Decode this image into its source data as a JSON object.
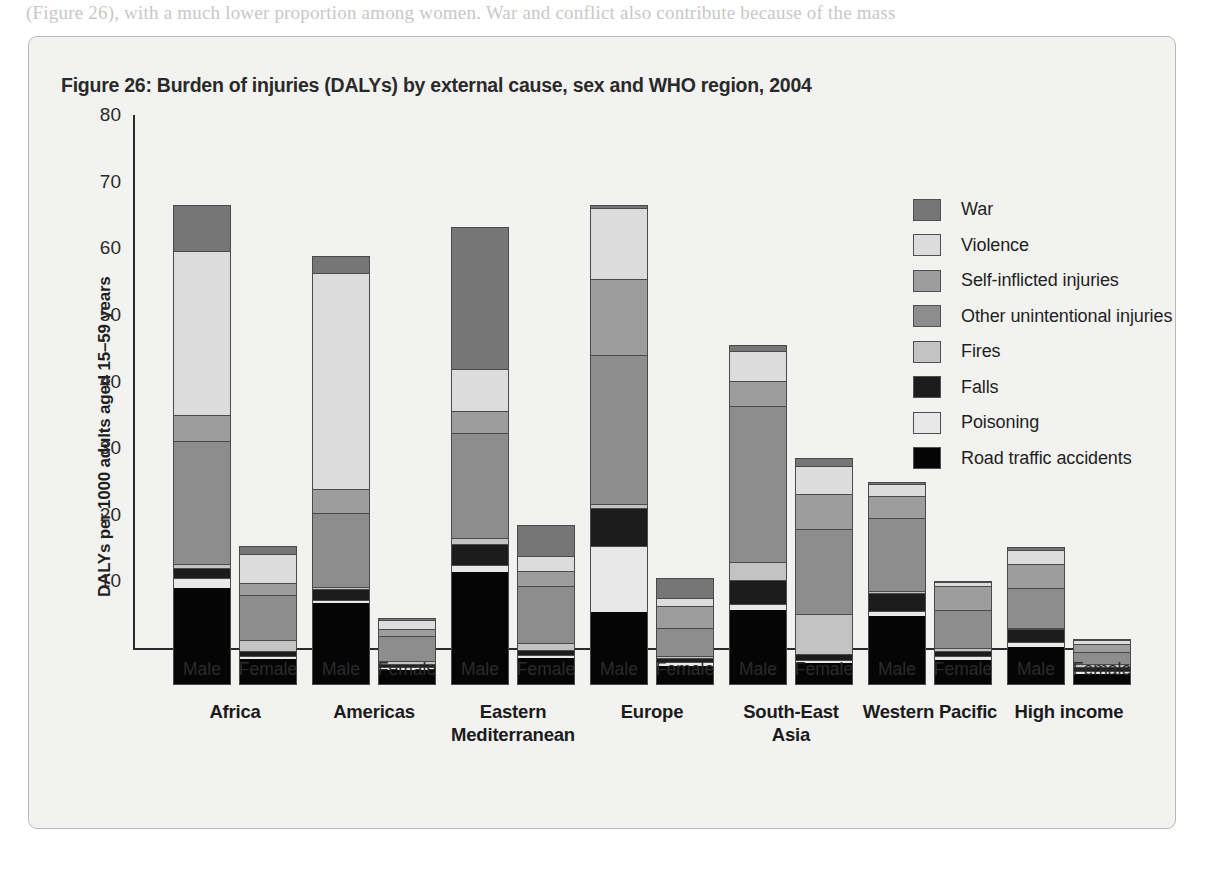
{
  "page": {
    "top_text_fragment": "(Figure 26), with a much lower proportion among women. War and conflict also contribute because of the mass"
  },
  "figure": {
    "title": "Figure 26: Burden of injuries (DALYs) by external cause, sex and WHO region, 2004"
  },
  "legend": {
    "position": "top-right",
    "items": [
      {
        "label": "War",
        "color": "#767676"
      },
      {
        "label": "Violence",
        "color": "#dcdcdc"
      },
      {
        "label": "Self-inflicted injuries",
        "color": "#9d9d9d"
      },
      {
        "label": "Other unintentional injuries",
        "color": "#8d8d8d"
      },
      {
        "label": "Fires",
        "color": "#c3c3c3"
      },
      {
        "label": "Falls",
        "color": "#1c1c1c"
      },
      {
        "label": "Poisoning",
        "color": "#e8e8e8"
      },
      {
        "label": "Road traffic accidents",
        "color": "#050505"
      }
    ]
  },
  "chart_data": {
    "type": "bar",
    "subtype": "stacked-vertical-grouped",
    "title": "Figure 26: Burden of injuries (DALYs) by external cause, sex and WHO region, 2004",
    "xlabel": "",
    "ylabel": "DALYs per 1000 adults aged 15–59 years",
    "ylim": [
      0,
      80
    ],
    "yticks": [
      10,
      20,
      30,
      40,
      50,
      60,
      70,
      80
    ],
    "ytick_labels": [
      "10",
      "20",
      "30",
      "40",
      "50",
      "60",
      "70",
      "80"
    ],
    "grid": false,
    "legend_position": "top-right",
    "group_labels": [
      "Africa",
      "Americas",
      "Eastern\nMediterranean",
      "Europe",
      "South-East\nAsia",
      "Western Pacific",
      "High income"
    ],
    "regions": [
      "Africa",
      "Americas",
      "Eastern Mediterranean",
      "Europe",
      "South-East Asia",
      "Western Pacific",
      "High income"
    ],
    "region_lines": [
      [
        "Africa"
      ],
      [
        "Americas"
      ],
      [
        "Eastern",
        "Mediterranean"
      ],
      [
        "Europe"
      ],
      [
        "South-East",
        "Asia"
      ],
      [
        "Western Pacific"
      ],
      [
        "High income"
      ]
    ],
    "sexes": [
      "Male",
      "Female"
    ],
    "stack_order_bottom_to_top": [
      "Road traffic accidents",
      "Poisoning",
      "Falls",
      "Fires",
      "Other unintentional injuries",
      "Self-inflicted injuries",
      "Violence",
      "War"
    ],
    "series": [
      {
        "name": "Road traffic accidents",
        "color": "#050505",
        "values": [
          14.6,
          3.9,
          12.3,
          2.3,
          17.0,
          4.0,
          11.0,
          2.8,
          11.3,
          3.3,
          10.4,
          3.8,
          5.7,
          1.7
        ]
      },
      {
        "name": "Poisoning",
        "color": "#e8e8e8",
        "values": [
          1.4,
          0.5,
          0.4,
          0.4,
          1.0,
          0.5,
          9.8,
          0.6,
          0.9,
          0.5,
          0.7,
          0.5,
          0.7,
          0.4
        ]
      },
      {
        "name": "Falls",
        "color": "#1c1c1c",
        "values": [
          1.6,
          0.7,
          1.7,
          0.5,
          3.2,
          0.8,
          5.7,
          0.6,
          3.6,
          0.9,
          2.7,
          0.8,
          2.0,
          0.6
        ]
      },
      {
        "name": "Fires",
        "color": "#c3c3c3",
        "values": [
          0.6,
          1.7,
          0.3,
          0.4,
          0.8,
          1.0,
          0.6,
          0.4,
          2.6,
          5.9,
          0.3,
          0.5,
          0.2,
          0.4
        ]
      },
      {
        "name": "Other unintentional injuries",
        "color": "#8d8d8d",
        "values": [
          18.5,
          6.7,
          11.1,
          3.7,
          15.9,
          8.5,
          22.5,
          4.2,
          23.5,
          12.8,
          10.9,
          5.7,
          6.0,
          1.9
        ]
      },
      {
        "name": "Self-inflicted injuries",
        "color": "#9d9d9d",
        "values": [
          3.9,
          1.8,
          3.6,
          1.1,
          3.3,
          2.3,
          11.3,
          3.3,
          3.7,
          5.3,
          3.3,
          3.5,
          3.6,
          1.2
        ]
      },
      {
        "name": "Violence",
        "color": "#dcdcdc",
        "values": [
          24.6,
          4.4,
          32.5,
          1.4,
          6.3,
          2.3,
          10.7,
          1.2,
          4.5,
          4.1,
          1.8,
          0.6,
          2.1,
          0.5
        ]
      },
      {
        "name": "War",
        "color": "#767676",
        "values": [
          6.8,
          1.2,
          2.5,
          0.3,
          21.2,
          4.6,
          0.5,
          2.9,
          1.0,
          1.3,
          0.4,
          0.2,
          0.4,
          0.2
        ]
      }
    ],
    "bar_totals": [
      73.0,
      20.9,
      64.4,
      10.1,
      68.7,
      24.0,
      72.1,
      16.0,
      51.1,
      34.1,
      30.5,
      15.6,
      20.7,
      6.9
    ],
    "bar_keys": [
      "Africa-Male",
      "Africa-Female",
      "Americas-Male",
      "Americas-Female",
      "Eastern Mediterranean-Male",
      "Eastern Mediterranean-Female",
      "Europe-Male",
      "Europe-Female",
      "South-East Asia-Male",
      "South-East Asia-Female",
      "Western Pacific-Male",
      "Western Pacific-Female",
      "High income-Male",
      "High income-Female"
    ]
  }
}
